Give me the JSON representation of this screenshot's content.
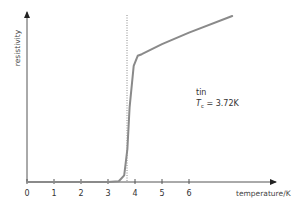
{
  "chart_data": {
    "type": "line",
    "title": "",
    "xlabel": "temperature/K",
    "ylabel": "resistivity",
    "x_ticks": [
      "0",
      "1",
      "2",
      "3",
      "4",
      "5",
      "6"
    ],
    "xlim": [
      0,
      7.8
    ],
    "y_ticks": [],
    "grid": false,
    "legend": null,
    "series": [
      {
        "name": "tin",
        "color": "#8a8a8a",
        "x": [
          0,
          3.0,
          3.4,
          3.6,
          3.72,
          3.8,
          3.95,
          4.1,
          4.25,
          5.0,
          6.0,
          7.6
        ],
        "y": [
          0,
          0,
          0.005,
          0.04,
          0.2,
          0.45,
          0.7,
          0.76,
          0.77,
          0.83,
          0.9,
          1.0
        ]
      }
    ],
    "reference_line": {
      "type": "vertical",
      "x": 3.72,
      "style": "dotted"
    },
    "annotations": [
      {
        "text": "tin"
      },
      {
        "text": "T",
        "subscript": "c",
        "suffix": " = 3.72K"
      }
    ]
  },
  "annotation": {
    "material": "tin",
    "tc_symbol": "T",
    "tc_subscript": "c",
    "tc_value": " = 3.72K"
  }
}
